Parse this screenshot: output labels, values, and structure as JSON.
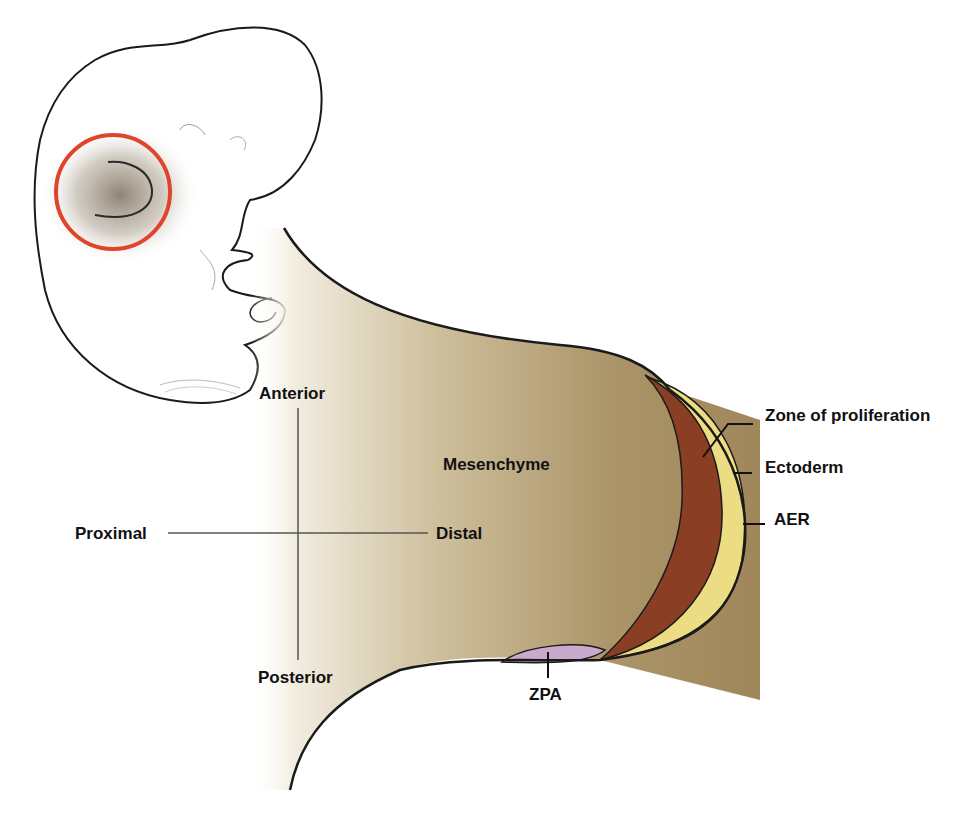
{
  "figure": {
    "type": "limb bud anatomy diagram",
    "colors": {
      "mesenchyme": "#a8926a",
      "zone_of_proliferation": "#8a3e24",
      "aer": "#ecdc84",
      "zpa": "#c9a9cc",
      "highlight_circle": "#e0442a",
      "outline": "#1a1a1a",
      "axis_lines": "#555555"
    }
  },
  "axes": {
    "anterior": "Anterior",
    "posterior": "Posterior",
    "proximal": "Proximal",
    "distal": "Distal"
  },
  "structures": {
    "mesenchyme": "Mesenchyme",
    "zone_of_proliferation": "Zone of proliferation",
    "ectoderm": "Ectoderm",
    "aer": "AER",
    "zpa": "ZPA"
  }
}
